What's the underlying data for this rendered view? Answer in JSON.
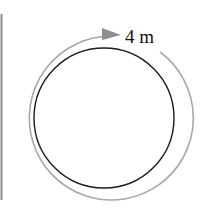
{
  "diagram": {
    "label": "4 m",
    "colors": {
      "circle": "#1a1a1a",
      "arrow": "#9a9a9a",
      "left_rule": "#8a8a8a",
      "label": "#111111"
    }
  }
}
